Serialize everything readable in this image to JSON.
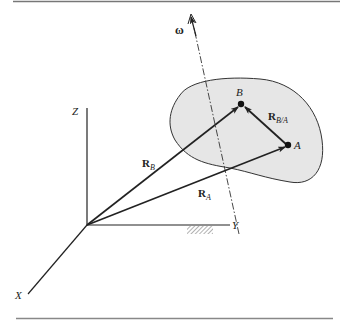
{
  "figure": {
    "axes": {
      "x_label": "X",
      "y_label": "Y",
      "z_label": "Z"
    },
    "points": {
      "a_label": "A",
      "b_label": "B"
    },
    "vectors": {
      "r_a": {
        "main": "R",
        "sub": "A"
      },
      "r_b": {
        "main": "R",
        "sub": "B"
      },
      "r_ba": {
        "main": "R",
        "sub": "B/A"
      }
    },
    "omega_label": "ω",
    "colors": {
      "body_fill": "#e6e6e6",
      "line": "#222222",
      "rule": "#777777"
    }
  }
}
